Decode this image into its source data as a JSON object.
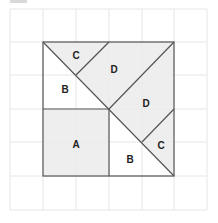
{
  "diagram": {
    "type": "tangram-square-dissection",
    "grid": {
      "cols": 6,
      "rows": 6,
      "cell_px": 33,
      "origin": [
        10,
        9
      ],
      "line_color": "#e6e6e6"
    },
    "outline_color": "#555555",
    "shade_color": "#eeeeee",
    "pieces": [
      {
        "label": "A",
        "shape": "square",
        "shaded": true
      },
      {
        "label": "B",
        "shape": "triangle",
        "shaded": false,
        "position": "left"
      },
      {
        "label": "B",
        "shape": "triangle",
        "shaded": false,
        "position": "bottom-right"
      },
      {
        "label": "C",
        "shape": "triangle",
        "shaded": true,
        "position": "top-left"
      },
      {
        "label": "C",
        "shape": "triangle",
        "shaded": true,
        "position": "right"
      },
      {
        "label": "D",
        "shape": "quadrilateral",
        "shaded": true,
        "position": "top"
      },
      {
        "label": "D",
        "shape": "quadrilateral",
        "shaded": true,
        "position": "middle-right"
      }
    ]
  },
  "labels": {
    "a": "A",
    "b1": "B",
    "b2": "B",
    "c1": "C",
    "c2": "C",
    "d1": "D",
    "d2": "D"
  }
}
